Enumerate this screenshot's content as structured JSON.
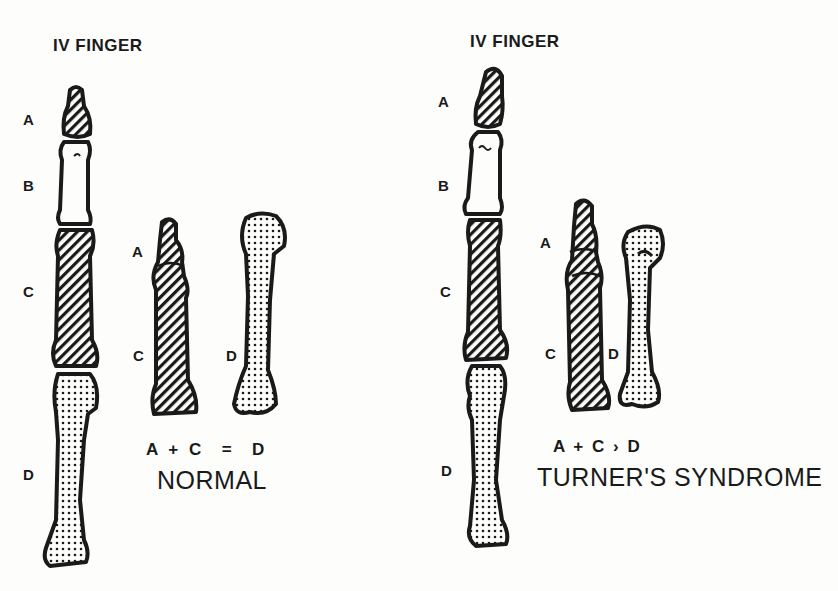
{
  "panels": [
    {
      "title": "IV FINGER",
      "finger_labels": [
        "A",
        "B",
        "C",
        "D"
      ],
      "detail_labels": {
        "a": "A",
        "c": "C",
        "d": "D"
      },
      "equation": "A + C  =  D",
      "caption": "NORMAL"
    },
    {
      "title": "IV FINGER",
      "finger_labels": [
        "A",
        "B",
        "C",
        "D"
      ],
      "detail_labels": {
        "a": "A",
        "c": "C",
        "d": "D"
      },
      "equation": "A + C › D",
      "caption": "TURNER'S SYNDROME"
    }
  ],
  "legend_patterns": {
    "A": "diagonal-hatch",
    "B": "blank",
    "C": "diagonal-hatch",
    "D": "dotted"
  },
  "colors": {
    "ink": "#1a1a1a",
    "paper": "#fdfdfb"
  }
}
